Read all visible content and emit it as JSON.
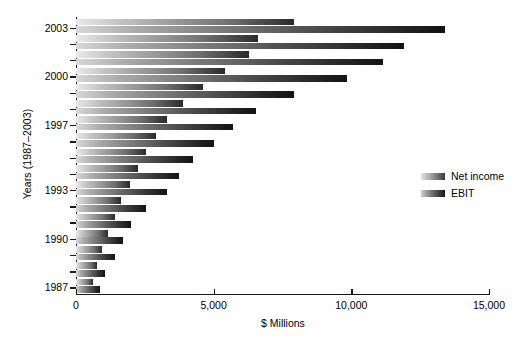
{
  "chart_data": {
    "type": "bar",
    "orientation": "horizontal",
    "title": "",
    "xlabel": "$ Millions",
    "ylabel": "Years (1987–2003)",
    "xlim": [
      0,
      15000
    ],
    "xticks": [
      0,
      5000,
      10000,
      15000
    ],
    "xtick_labels": [
      "0",
      "5,000",
      "10,000",
      "15,000"
    ],
    "grid": false,
    "legend_position": "right-middle",
    "categories": [
      "2003",
      "2002",
      "2001",
      "2000",
      "1999",
      "1998",
      "1997",
      "1996",
      "1995",
      "1994",
      "1993",
      "1992",
      "1991",
      "1990",
      "1989",
      "1988",
      "1987"
    ],
    "ytick_labels": [
      "2003",
      "2000",
      "1997",
      "1993",
      "1990",
      "1987"
    ],
    "series": [
      {
        "name": "Net income",
        "color": "#9a9a9a",
        "values": [
          7900,
          6600,
          6300,
          5400,
          4600,
          3900,
          3300,
          2900,
          2550,
          2250,
          1950,
          1650,
          1400,
          1150,
          950,
          780,
          620
        ]
      },
      {
        "name": "EBIT",
        "color": "#333333",
        "values": [
          13400,
          11900,
          11150,
          9850,
          7900,
          6550,
          5700,
          5000,
          4250,
          3750,
          3300,
          2550,
          2000,
          1700,
          1400,
          1050,
          870
        ]
      }
    ]
  },
  "legend": {
    "items": [
      {
        "label": "Net income",
        "key": "net"
      },
      {
        "label": "EBIT",
        "key": "ebit"
      }
    ]
  },
  "axes": {
    "x_title": "$ Millions",
    "y_title": "Years (1987–2003)"
  }
}
